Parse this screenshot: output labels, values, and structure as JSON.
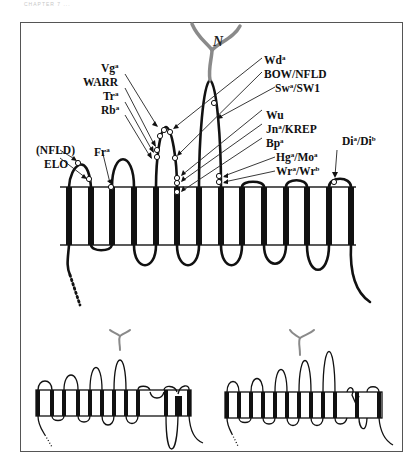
{
  "figure": {
    "caption_faint": "CHAPTER 7 ...",
    "n_terminus_label": "N",
    "colors": {
      "membrane": "#111111",
      "loop": "#111111",
      "glycan": "#8a8a8a",
      "frame": "#555555",
      "site_marker_fill": "#ffffff"
    },
    "top_panel": {
      "description": "Polytopic membrane protein with 14 transmembrane segments; antigen sites marked on extracellular loops",
      "transmembrane_segments": 14,
      "labels": [
        {
          "id": "nfld",
          "text": "(NFLD)"
        },
        {
          "id": "elo",
          "text": "ELO"
        },
        {
          "id": "fr",
          "base": "Fr",
          "sup": "a"
        },
        {
          "id": "vg",
          "base": "Vg",
          "sup": "a"
        },
        {
          "id": "warr",
          "text": "WARR"
        },
        {
          "id": "tr",
          "base": "Tr",
          "sup": "a"
        },
        {
          "id": "rb",
          "base": "Rb",
          "sup": "a"
        },
        {
          "id": "wd",
          "base": "Wd",
          "sup": "a"
        },
        {
          "id": "bow",
          "text": "BOW/NFLD"
        },
        {
          "id": "sw",
          "base": "Sw",
          "sup": "a",
          "suffix": "/SW1"
        },
        {
          "id": "wu",
          "text": "Wu"
        },
        {
          "id": "jn",
          "base": "Jn",
          "sup": "a",
          "suffix": "/KREP"
        },
        {
          "id": "bp",
          "base": "Bp",
          "sup": "a"
        },
        {
          "id": "hg",
          "base": "Hg",
          "sup": "a",
          "mid": "/Mo",
          "sup2": "a"
        },
        {
          "id": "wr",
          "base": "Wr",
          "sup": "a",
          "mid": "/Wr",
          "sup2": "b"
        },
        {
          "id": "di",
          "base": "Di",
          "sup": "a",
          "mid": "/Di",
          "sup2": "b"
        }
      ]
    },
    "bottom_panels": [
      {
        "id": "variant-left",
        "transmembrane_segments": 12
      },
      {
        "id": "variant-right",
        "transmembrane_segments": 12
      }
    ]
  }
}
